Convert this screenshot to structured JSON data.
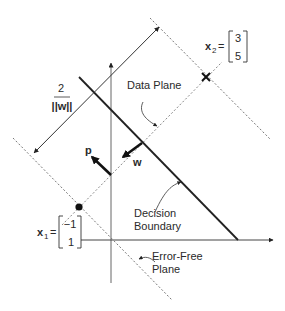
{
  "diagram": {
    "type": "svm-geometry",
    "labels": {
      "margin_numerator": "2",
      "margin_denominator": "||w||",
      "data_plane": "Data Plane",
      "decision_boundary_line1": "Decision",
      "decision_boundary_line2": "Boundary",
      "error_free_line1": "Error-Free",
      "error_free_line2": "Plane",
      "vector_p": "p",
      "vector_w": "w"
    },
    "points": {
      "x1": {
        "name": "x",
        "subscript": "1",
        "equals": "=",
        "vector": [
          "−1",
          "1"
        ],
        "marker": "filled-circle"
      },
      "x2": {
        "name": "x",
        "subscript": "2",
        "equals": "=",
        "vector": [
          "3",
          "5"
        ],
        "marker": "cross"
      }
    },
    "colors": {
      "line": "#222222",
      "dashed": "#777777",
      "text": "#2a2a2a",
      "background": "#ffffff"
    }
  }
}
